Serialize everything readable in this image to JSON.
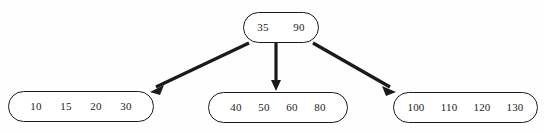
{
  "diagram": {
    "type": "b-tree",
    "stroke_color": "#1a1a1a",
    "text_color": "#1c1c1c",
    "background_color": "#fefefe",
    "root": {
      "label": "root-node",
      "keys": [
        "35",
        "90"
      ]
    },
    "leaves": [
      {
        "label": "leaf-node-left",
        "keys": [
          "10",
          "15",
          "20",
          "30"
        ]
      },
      {
        "label": "leaf-node-middle",
        "keys": [
          "40",
          "50",
          "60",
          "80"
        ]
      },
      {
        "label": "leaf-node-right",
        "keys": [
          "100",
          "110",
          "120",
          "130"
        ]
      }
    ],
    "edges": [
      {
        "name": "edge-root-to-left",
        "direction": "down-left"
      },
      {
        "name": "edge-root-to-middle",
        "direction": "down"
      },
      {
        "name": "edge-root-to-right",
        "direction": "down-right"
      }
    ]
  }
}
